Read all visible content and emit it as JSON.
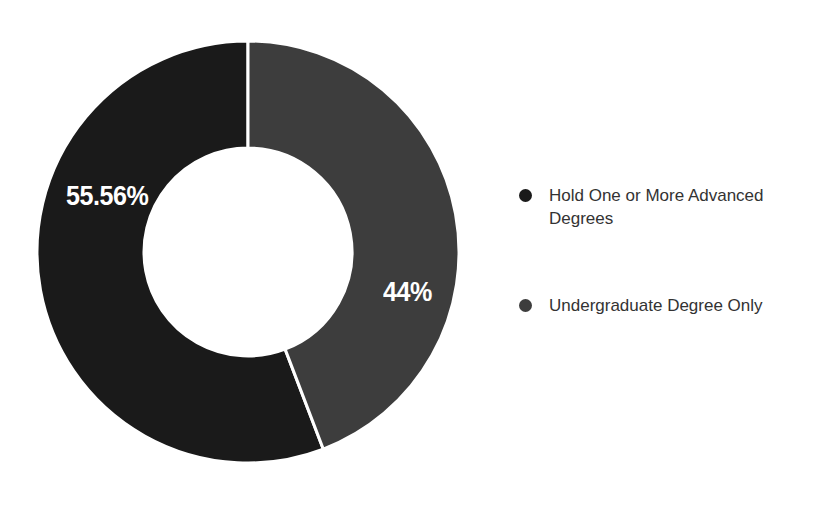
{
  "chart_data": {
    "type": "pie",
    "variant": "donut",
    "title": "",
    "subtitle": "",
    "xlabel": "",
    "ylabel": "",
    "grid": false,
    "legend_position": "right",
    "start_angle_deg": 0,
    "direction": "clockwise",
    "inner_radius_ratio": 0.49,
    "center": {
      "x": 248,
      "y": 252
    },
    "outer_radius": 211,
    "inner_radius": 104,
    "background_color": "#ffffff",
    "divider_color": "#ffffff",
    "categories": [
      "Hold One or More Advanced Degrees",
      "Undergraduate Degree Only"
    ],
    "values": [
      55.56,
      44
    ],
    "data_labels": [
      "55.56%",
      "44%"
    ],
    "colors": [
      "#1a1a1a",
      "#3d3d3d"
    ],
    "slices": [
      {
        "label": "Hold One or More Advanced Degrees",
        "value": 55.56,
        "data_label": "55.56%",
        "color": "#1a1a1a",
        "label_color": "#ffffff"
      },
      {
        "label": "Undergraduate Degree Only",
        "value": 44,
        "data_label": "44%",
        "color": "#3d3d3d",
        "label_color": "#ffffff"
      }
    ]
  },
  "legend": {
    "items": [
      {
        "label": "Hold One or More Advanced Degrees",
        "color": "#1a1a1a",
        "marker": "circle-marker"
      },
      {
        "label": "Undergraduate Degree Only",
        "color": "#3d3d3d",
        "marker": "circle-marker"
      }
    ]
  }
}
